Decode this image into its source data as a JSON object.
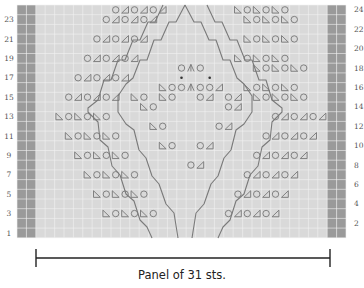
{
  "caption": "Panel of 31 sts.",
  "colors": {
    "cell_bg": "#d9d9d9",
    "grid_line": "#f2f2f2",
    "edge_cell": "#9a9a9a",
    "symbol": "#777777",
    "cable": "#7a7a7a",
    "bar": "#222222"
  },
  "grid": {
    "rows": 24,
    "stitch_columns": 31,
    "edge_columns_each_side": 2,
    "left_x": 17,
    "top_y": 5,
    "cell_w": 9.4,
    "cell_h": 9.7
  },
  "row_labels": {
    "left": [
      "1",
      "3",
      "5",
      "7",
      "9",
      "11",
      "13",
      "15",
      "17",
      "19",
      "21",
      "23"
    ],
    "right": [
      "2",
      "4",
      "6",
      "8",
      "10",
      "12",
      "14",
      "16",
      "18",
      "20",
      "22",
      "24"
    ]
  },
  "legend_symbols": {
    "O": "yarn-over",
    "A": "k2tog (slanting right)",
    "B": "ssk (slanting left)",
    "M": "double decrease",
    "*": "bobble/dot"
  },
  "rows": [
    {
      "row": 24,
      "symbols": [
        [
          9,
          "O"
        ],
        [
          10,
          "A"
        ],
        [
          11,
          "O"
        ],
        [
          12,
          "A"
        ],
        [
          13,
          "O"
        ],
        [
          14,
          "A"
        ],
        [
          22,
          "B"
        ],
        [
          23,
          "O"
        ],
        [
          24,
          "B"
        ],
        [
          25,
          "O"
        ],
        [
          26,
          "B"
        ],
        [
          27,
          "O"
        ]
      ]
    },
    {
      "row": 23,
      "symbols": [
        [
          8,
          "O"
        ],
        [
          9,
          "A"
        ],
        [
          10,
          "O"
        ],
        [
          11,
          "A"
        ],
        [
          12,
          "O"
        ],
        [
          13,
          "A"
        ],
        [
          23,
          "B"
        ],
        [
          24,
          "O"
        ],
        [
          25,
          "B"
        ],
        [
          26,
          "O"
        ],
        [
          27,
          "B"
        ],
        [
          28,
          "O"
        ]
      ]
    },
    {
      "row": 22,
      "symbols": []
    },
    {
      "row": 21,
      "symbols": [
        [
          7,
          "O"
        ],
        [
          8,
          "A"
        ],
        [
          9,
          "O"
        ],
        [
          10,
          "A"
        ],
        [
          11,
          "O"
        ],
        [
          12,
          "A"
        ],
        [
          23,
          "B"
        ],
        [
          24,
          "O"
        ],
        [
          25,
          "B"
        ],
        [
          26,
          "O"
        ],
        [
          27,
          "B"
        ],
        [
          28,
          "O"
        ]
      ]
    },
    {
      "row": 20,
      "symbols": []
    },
    {
      "row": 19,
      "symbols": [
        [
          6,
          "O"
        ],
        [
          7,
          "A"
        ],
        [
          8,
          "O"
        ],
        [
          9,
          "A"
        ],
        [
          10,
          "O"
        ],
        [
          11,
          "A"
        ],
        [
          22,
          "B"
        ],
        [
          23,
          "O"
        ],
        [
          24,
          "B"
        ],
        [
          25,
          "O"
        ],
        [
          26,
          "B"
        ],
        [
          27,
          "O"
        ]
      ]
    },
    {
      "row": 18,
      "symbols": [
        [
          16,
          "O"
        ],
        [
          17,
          "M"
        ],
        [
          18,
          "O"
        ],
        [
          24,
          "B"
        ],
        [
          25,
          "O"
        ],
        [
          26,
          "B"
        ],
        [
          27,
          "O"
        ],
        [
          28,
          "B"
        ],
        [
          29,
          "O"
        ]
      ]
    },
    {
      "row": 17,
      "symbols": [
        [
          5,
          "O"
        ],
        [
          6,
          "A"
        ],
        [
          7,
          "O"
        ],
        [
          8,
          "A"
        ],
        [
          9,
          "O"
        ],
        [
          10,
          "A"
        ],
        [
          16,
          "*"
        ],
        [
          19,
          "*"
        ]
      ]
    },
    {
      "row": 16,
      "symbols": [
        [
          14,
          "B"
        ],
        [
          15,
          "O"
        ],
        [
          16,
          "O"
        ],
        [
          17,
          "M"
        ],
        [
          18,
          "O"
        ],
        [
          19,
          "O"
        ],
        [
          20,
          "A"
        ],
        [
          23,
          "B"
        ],
        [
          24,
          "O"
        ],
        [
          25,
          "B"
        ],
        [
          26,
          "O"
        ],
        [
          27,
          "B"
        ],
        [
          28,
          "O"
        ]
      ]
    },
    {
      "row": 15,
      "symbols": [
        [
          4,
          "O"
        ],
        [
          5,
          "A"
        ],
        [
          6,
          "O"
        ],
        [
          7,
          "A"
        ],
        [
          8,
          "O"
        ],
        [
          9,
          "A"
        ],
        [
          11,
          "B"
        ],
        [
          12,
          "O"
        ],
        [
          14,
          "B"
        ],
        [
          15,
          "O"
        ],
        [
          18,
          "O"
        ],
        [
          19,
          "A"
        ],
        [
          21,
          "O"
        ],
        [
          22,
          "A"
        ],
        [
          24,
          "B"
        ],
        [
          25,
          "O"
        ],
        [
          26,
          "B"
        ],
        [
          27,
          "O"
        ],
        [
          28,
          "B"
        ],
        [
          29,
          "O"
        ]
      ]
    },
    {
      "row": 14,
      "symbols": [
        [
          12,
          "B"
        ],
        [
          13,
          "O"
        ],
        [
          21,
          "O"
        ],
        [
          22,
          "A"
        ]
      ]
    },
    {
      "row": 13,
      "symbols": [
        [
          3,
          "B"
        ],
        [
          4,
          "O"
        ],
        [
          5,
          "B"
        ],
        [
          6,
          "O"
        ],
        [
          7,
          "B"
        ],
        [
          8,
          "O"
        ],
        [
          26,
          "O"
        ],
        [
          27,
          "A"
        ],
        [
          28,
          "O"
        ],
        [
          29,
          "A"
        ],
        [
          30,
          "O"
        ],
        [
          31,
          "A"
        ]
      ]
    },
    {
      "row": 12,
      "symbols": [
        [
          13,
          "B"
        ],
        [
          14,
          "O"
        ],
        [
          20,
          "O"
        ],
        [
          21,
          "A"
        ]
      ]
    },
    {
      "row": 11,
      "symbols": [
        [
          4,
          "B"
        ],
        [
          5,
          "O"
        ],
        [
          6,
          "B"
        ],
        [
          7,
          "O"
        ],
        [
          8,
          "B"
        ],
        [
          9,
          "O"
        ],
        [
          25,
          "O"
        ],
        [
          26,
          "A"
        ],
        [
          27,
          "O"
        ],
        [
          28,
          "A"
        ],
        [
          29,
          "O"
        ],
        [
          30,
          "A"
        ]
      ]
    },
    {
      "row": 10,
      "symbols": [
        [
          14,
          "B"
        ],
        [
          15,
          "O"
        ],
        [
          18,
          "O"
        ],
        [
          19,
          "A"
        ]
      ]
    },
    {
      "row": 9,
      "symbols": [
        [
          5,
          "B"
        ],
        [
          6,
          "O"
        ],
        [
          7,
          "B"
        ],
        [
          8,
          "O"
        ],
        [
          9,
          "B"
        ],
        [
          10,
          "O"
        ],
        [
          24,
          "O"
        ],
        [
          25,
          "A"
        ],
        [
          26,
          "O"
        ],
        [
          27,
          "A"
        ],
        [
          28,
          "O"
        ],
        [
          29,
          "A"
        ]
      ]
    },
    {
      "row": 8,
      "symbols": [
        [
          17,
          "O"
        ],
        [
          18,
          "A"
        ]
      ]
    },
    {
      "row": 7,
      "symbols": [
        [
          6,
          "B"
        ],
        [
          7,
          "O"
        ],
        [
          8,
          "B"
        ],
        [
          9,
          "O"
        ],
        [
          10,
          "B"
        ],
        [
          11,
          "O"
        ],
        [
          23,
          "O"
        ],
        [
          24,
          "A"
        ],
        [
          25,
          "O"
        ],
        [
          26,
          "A"
        ],
        [
          27,
          "O"
        ],
        [
          28,
          "A"
        ]
      ]
    },
    {
      "row": 6,
      "symbols": []
    },
    {
      "row": 5,
      "symbols": [
        [
          7,
          "B"
        ],
        [
          8,
          "O"
        ],
        [
          9,
          "B"
        ],
        [
          10,
          "O"
        ],
        [
          11,
          "B"
        ],
        [
          12,
          "O"
        ],
        [
          22,
          "O"
        ],
        [
          23,
          "A"
        ],
        [
          24,
          "O"
        ],
        [
          25,
          "A"
        ],
        [
          26,
          "O"
        ],
        [
          27,
          "A"
        ]
      ]
    },
    {
      "row": 4,
      "symbols": []
    },
    {
      "row": 3,
      "symbols": [
        [
          8,
          "B"
        ],
        [
          9,
          "O"
        ],
        [
          10,
          "B"
        ],
        [
          11,
          "O"
        ],
        [
          12,
          "B"
        ],
        [
          13,
          "O"
        ],
        [
          21,
          "O"
        ],
        [
          22,
          "A"
        ],
        [
          23,
          "O"
        ],
        [
          24,
          "A"
        ],
        [
          25,
          "O"
        ],
        [
          26,
          "A"
        ]
      ]
    },
    {
      "row": 2,
      "symbols": []
    },
    {
      "row": 1,
      "symbols": []
    }
  ],
  "cables": [
    {
      "name": "outer-left",
      "points": [
        [
          163,
          5
        ],
        [
          155,
          22
        ],
        [
          148,
          22
        ],
        [
          140,
          40
        ],
        [
          133,
          40
        ],
        [
          125,
          60
        ],
        [
          118,
          60
        ],
        [
          111,
          80
        ],
        [
          104,
          80
        ],
        [
          98,
          100
        ],
        [
          88,
          108
        ],
        [
          88,
          112
        ],
        [
          98,
          122
        ],
        [
          100,
          140
        ],
        [
          108,
          147
        ],
        [
          112,
          166
        ],
        [
          120,
          175
        ],
        [
          126,
          194
        ],
        [
          134,
          201
        ],
        [
          140,
          220
        ],
        [
          147,
          227
        ],
        [
          152,
          238
        ]
      ]
    },
    {
      "name": "inner-left",
      "points": [
        [
          185,
          5
        ],
        [
          176,
          22
        ],
        [
          169,
          22
        ],
        [
          161,
          40
        ],
        [
          154,
          40
        ],
        [
          147,
          60
        ],
        [
          140,
          60
        ],
        [
          133,
          78
        ],
        [
          126,
          84
        ],
        [
          118,
          96
        ],
        [
          118,
          112
        ],
        [
          126,
          124
        ],
        [
          134,
          130
        ],
        [
          139,
          150
        ],
        [
          146,
          158
        ],
        [
          152,
          176
        ],
        [
          159,
          184
        ],
        [
          166,
          204
        ],
        [
          174,
          213
        ],
        [
          178,
          238
        ]
      ]
    },
    {
      "name": "inner-right",
      "points": [
        [
          185,
          5
        ],
        [
          194,
          22
        ],
        [
          201,
          22
        ],
        [
          209,
          40
        ],
        [
          216,
          40
        ],
        [
          223,
          60
        ],
        [
          230,
          60
        ],
        [
          237,
          78
        ],
        [
          244,
          84
        ],
        [
          252,
          96
        ],
        [
          252,
          112
        ],
        [
          244,
          124
        ],
        [
          236,
          130
        ],
        [
          231,
          150
        ],
        [
          224,
          158
        ],
        [
          218,
          176
        ],
        [
          211,
          184
        ],
        [
          204,
          204
        ],
        [
          196,
          213
        ],
        [
          192,
          238
        ]
      ]
    },
    {
      "name": "outer-right",
      "points": [
        [
          207,
          5
        ],
        [
          215,
          22
        ],
        [
          222,
          22
        ],
        [
          230,
          40
        ],
        [
          237,
          40
        ],
        [
          245,
          60
        ],
        [
          252,
          60
        ],
        [
          259,
          80
        ],
        [
          266,
          80
        ],
        [
          272,
          100
        ],
        [
          282,
          108
        ],
        [
          282,
          112
        ],
        [
          272,
          122
        ],
        [
          270,
          140
        ],
        [
          262,
          147
        ],
        [
          258,
          166
        ],
        [
          250,
          175
        ],
        [
          244,
          194
        ],
        [
          236,
          201
        ],
        [
          230,
          220
        ],
        [
          223,
          227
        ],
        [
          218,
          238
        ]
      ]
    }
  ],
  "panel_bar": {
    "x1": 36,
    "x2": 330,
    "y": 258,
    "tick_half": 9
  }
}
